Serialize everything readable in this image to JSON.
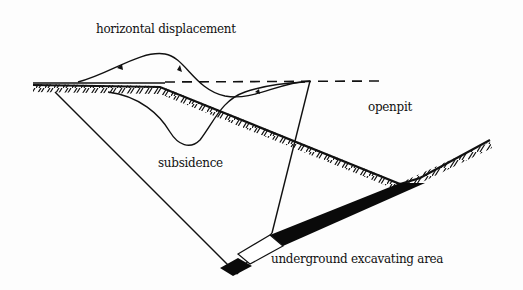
{
  "diagram": {
    "type": "cross-section schematic",
    "labels": {
      "horizontal_displacement": "horizontal displacement",
      "openpit": "openpit",
      "subsidence": "subsidence",
      "underground_excavating_area": "underground excavating area"
    },
    "elements": [
      "original ground surface (dashed line)",
      "hatched slope surface of the open pit",
      "horizontal displacement curve with arrow markers",
      "subsidence curve",
      "boundary/rupture lines converging at the underground excavating area",
      "ore body / seam (black band)"
    ],
    "colors": {
      "line": "#111111",
      "background": "#fdfdfd",
      "seam": "#0a0a0a"
    }
  }
}
